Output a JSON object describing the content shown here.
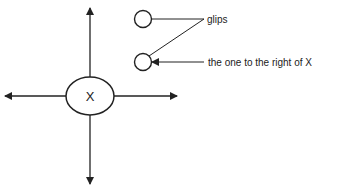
{
  "diagram": {
    "center_node": {
      "label": "X"
    },
    "labels": {
      "glips": "glips",
      "right_of_x": "the one to the right of X"
    },
    "colors": {
      "stroke": "#222222",
      "background": "#ffffff"
    }
  }
}
